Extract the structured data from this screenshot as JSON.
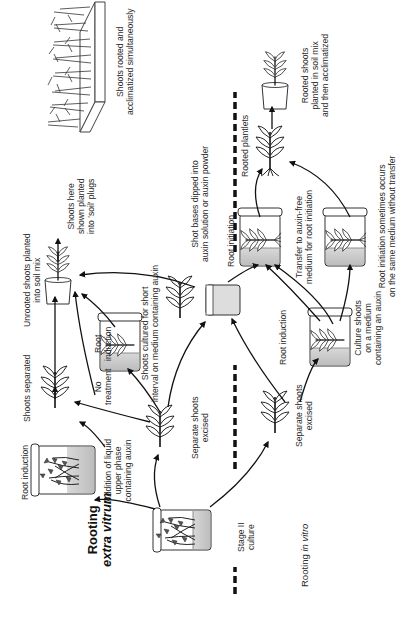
{
  "diagram": {
    "type": "flow-diagram",
    "orientation": "rotated-90-ccw",
    "sections": {
      "extra_vitrum": {
        "title_line1": "Rooting",
        "title_line2": "extra vitrum"
      },
      "in_vitro": {
        "title_prefix": "Rooting ",
        "title_italic": "in vitro"
      }
    },
    "labels": {
      "stage2": [
        "Stage II",
        "culture"
      ],
      "root_induction_top": "Root induction",
      "addition_liquid": [
        "Addition of liquid",
        "upper phase",
        "containing auxin"
      ],
      "separate_shoots_top": [
        "Separate shoots",
        "excised"
      ],
      "no_treatment": [
        "No",
        "treatment"
      ],
      "shoots_separated": "Shoots separated",
      "root_induction_mid": [
        "Root",
        "induction"
      ],
      "shoots_cultured": [
        "Shoots cultured for short",
        "interval on medium containing auxin"
      ],
      "unrooted_planted": [
        "Unrooted shoots planted",
        "into soil mix"
      ],
      "shown_planted": [
        "Shoots here",
        "shown planted",
        "into 'soil' plugs"
      ],
      "shot_bases": [
        "Shot bases dipped into",
        "auxin solution or auxin powder"
      ],
      "tray": [
        "Shoots rooted and",
        "acclimatized simultaneously"
      ],
      "separate_shoots_bottom": [
        "Separate shoots",
        "excised"
      ],
      "root_induction_bottom": "Root induction",
      "culture_shoots": [
        "Culture shoots",
        "on a medium",
        "containing an auxin"
      ],
      "root_initiation": "Root initiation",
      "transfer": [
        "Transfer to auxin-free",
        "medium for root initiation"
      ],
      "root_initiation_same": [
        "Root initiation sometimes occurs",
        "on the same medium without transfer"
      ],
      "rooted_plantlets": "Rooted plantlets",
      "rooted_shoots_planted": [
        "Rooted shoots",
        "planted in soil mix",
        "and then acclimatized"
      ]
    },
    "nodes": [
      {
        "id": "stage2-jar",
        "icon": "culture-jar-with-shoot-cluster"
      },
      {
        "id": "root-induction-liquid-jar",
        "icon": "culture-jar-with-shoot-cluster"
      },
      {
        "id": "separate-shoot-top",
        "icon": "shoot"
      },
      {
        "id": "shoots-separated",
        "icon": "shoot"
      },
      {
        "id": "root-induction-jar",
        "icon": "culture-jar-with-shoot"
      },
      {
        "id": "auxin-dip-vial",
        "icon": "vial"
      },
      {
        "id": "dip-shoot",
        "icon": "shoot"
      },
      {
        "id": "unrooted-pot",
        "icon": "potted-shoot"
      },
      {
        "id": "soil-plug-tray",
        "icon": "tray-of-shoots"
      },
      {
        "id": "separate-shoot-bottom",
        "icon": "shoot"
      },
      {
        "id": "culture-auxin-jar",
        "icon": "culture-jar-with-shoot"
      },
      {
        "id": "root-initiation-jar",
        "icon": "culture-jar-with-rooted-shoot"
      },
      {
        "id": "same-medium-jar",
        "icon": "culture-jar-with-rooted-shoot"
      },
      {
        "id": "rooted-plantlet",
        "icon": "rooted-shoot"
      },
      {
        "id": "final-pot",
        "icon": "potted-shoot"
      }
    ],
    "divider": "dashed line separating extra vitrum (top) and in vitro (bottom)"
  }
}
